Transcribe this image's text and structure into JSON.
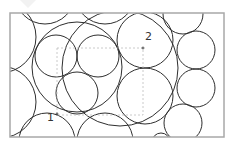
{
  "diagram": {
    "frame": {
      "x": 10,
      "y": 13,
      "width": 214,
      "height": 124,
      "stroke": "#a8a8a8"
    },
    "circle_stroke": "#2e2e2e",
    "dash_stroke": "#bdbdbd",
    "circles": [
      {
        "id": "left-top",
        "cx": 0,
        "cy": 37,
        "r": 36
      },
      {
        "id": "left-bottom",
        "cx": 0,
        "cy": 102,
        "r": 36
      },
      {
        "id": "top-1",
        "cx": 45,
        "cy": -6,
        "r": 30
      },
      {
        "id": "top-2",
        "cx": 105,
        "cy": -6,
        "r": 30
      },
      {
        "id": "big-left",
        "cx": 77,
        "cy": 67,
        "r": 45
      },
      {
        "id": "inner-left",
        "cx": 56,
        "cy": 56,
        "r": 21
      },
      {
        "id": "inner-right",
        "cx": 98,
        "cy": 56,
        "r": 21
      },
      {
        "id": "inner-bottom",
        "cx": 77,
        "cy": 93,
        "r": 21
      },
      {
        "id": "bottom-1",
        "cx": 47,
        "cy": 141,
        "r": 28
      },
      {
        "id": "bottom-2",
        "cx": 105,
        "cy": 141,
        "r": 28
      },
      {
        "id": "mid-top",
        "cx": 145,
        "cy": 40,
        "r": 28
      },
      {
        "id": "mid-bottom",
        "cx": 145,
        "cy": 96,
        "r": 28
      },
      {
        "id": "mid-enclose",
        "cx": 120,
        "cy": 68,
        "r": 58
      },
      {
        "id": "right-top",
        "cx": 183,
        "cy": 14,
        "r": 20
      },
      {
        "id": "right-2",
        "cx": 196,
        "cy": 50,
        "r": 19
      },
      {
        "id": "right-3",
        "cx": 196,
        "cy": 88,
        "r": 19
      },
      {
        "id": "right-bottom",
        "cx": 183,
        "cy": 123,
        "r": 19
      },
      {
        "id": "bottom-small",
        "cx": 161,
        "cy": 142,
        "r": 9
      }
    ],
    "dashed_rect": {
      "x": 57,
      "y": 48,
      "width": 86,
      "height": 67
    },
    "points": [
      {
        "label": "1",
        "x": 57,
        "y": 114,
        "label_x": 47,
        "label_y": 121
      },
      {
        "label": "2",
        "x": 143,
        "y": 48,
        "label_x": 145,
        "label_y": 40
      }
    ]
  }
}
